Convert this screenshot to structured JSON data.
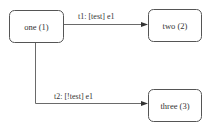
{
  "diagram": {
    "type": "state-machine",
    "states": [
      {
        "id": "one",
        "label": "one (1)",
        "x": 9,
        "y": 10,
        "w": 54,
        "h": 32
      },
      {
        "id": "two",
        "label": "two (2)",
        "x": 148,
        "y": 9,
        "w": 53,
        "h": 32
      },
      {
        "id": "three",
        "label": "three (3)",
        "x": 148,
        "y": 89,
        "w": 53,
        "h": 32
      }
    ],
    "transitions": [
      {
        "id": "t1",
        "from": "one",
        "to": "two",
        "label": "t1: [test] e1"
      },
      {
        "id": "t2",
        "from": "one",
        "to": "three",
        "label": "t2: [!test] e1"
      }
    ],
    "colors": {
      "box_stroke": "#555555",
      "edge": "#6a6a6a",
      "text": "#333333",
      "background": "#ffffff"
    }
  }
}
